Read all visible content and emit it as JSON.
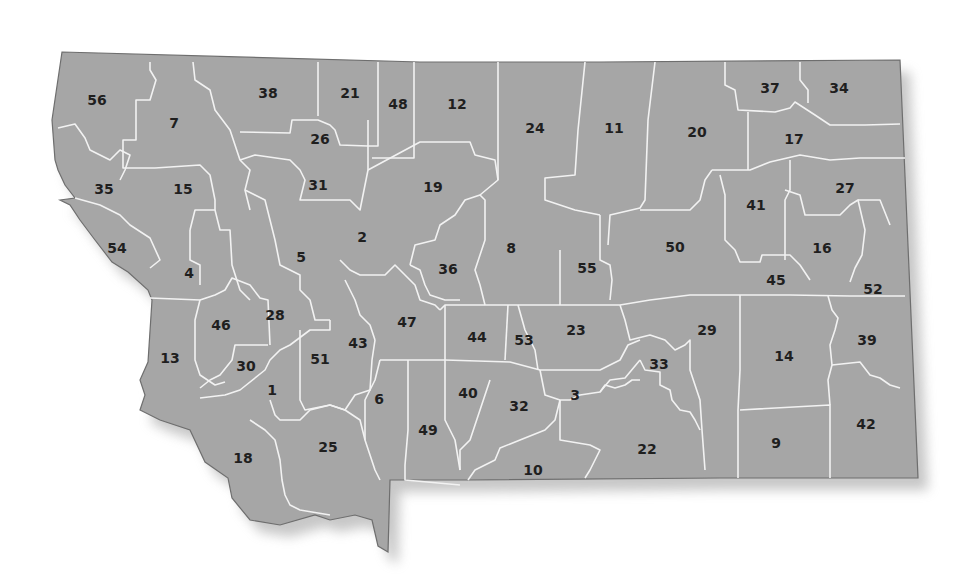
{
  "map": {
    "subject": "Montana county map with numbered counties",
    "colors": {
      "land": "#a6a6a6",
      "border": "#f2f2f2",
      "outline": "#6e6e6e",
      "label": "#1f1f1f",
      "background": "#ffffff"
    },
    "counties": [
      {
        "id": "56",
        "x": 97,
        "y": 100
      },
      {
        "id": "7",
        "x": 174,
        "y": 123
      },
      {
        "id": "38",
        "x": 268,
        "y": 93
      },
      {
        "id": "21",
        "x": 350,
        "y": 93
      },
      {
        "id": "48",
        "x": 398,
        "y": 104
      },
      {
        "id": "12",
        "x": 457,
        "y": 104
      },
      {
        "id": "24",
        "x": 535,
        "y": 128
      },
      {
        "id": "11",
        "x": 614,
        "y": 128
      },
      {
        "id": "20",
        "x": 697,
        "y": 132
      },
      {
        "id": "37",
        "x": 770,
        "y": 88
      },
      {
        "id": "34",
        "x": 839,
        "y": 88
      },
      {
        "id": "17",
        "x": 794,
        "y": 139
      },
      {
        "id": "26",
        "x": 320,
        "y": 139
      },
      {
        "id": "35",
        "x": 104,
        "y": 189
      },
      {
        "id": "15",
        "x": 183,
        "y": 189
      },
      {
        "id": "31",
        "x": 318,
        "y": 185
      },
      {
        "id": "19",
        "x": 433,
        "y": 187
      },
      {
        "id": "41",
        "x": 756,
        "y": 205
      },
      {
        "id": "27",
        "x": 845,
        "y": 188
      },
      {
        "id": "2",
        "x": 362,
        "y": 237
      },
      {
        "id": "8",
        "x": 511,
        "y": 248
      },
      {
        "id": "36",
        "x": 448,
        "y": 269
      },
      {
        "id": "55",
        "x": 587,
        "y": 268
      },
      {
        "id": "50",
        "x": 675,
        "y": 247
      },
      {
        "id": "16",
        "x": 822,
        "y": 248
      },
      {
        "id": "45",
        "x": 776,
        "y": 280
      },
      {
        "id": "52",
        "x": 873,
        "y": 289
      },
      {
        "id": "54",
        "x": 117,
        "y": 248
      },
      {
        "id": "4",
        "x": 189,
        "y": 273
      },
      {
        "id": "5",
        "x": 301,
        "y": 257
      },
      {
        "id": "46",
        "x": 221,
        "y": 325
      },
      {
        "id": "28",
        "x": 275,
        "y": 315
      },
      {
        "id": "47",
        "x": 407,
        "y": 322
      },
      {
        "id": "44",
        "x": 477,
        "y": 337
      },
      {
        "id": "53",
        "x": 524,
        "y": 340
      },
      {
        "id": "23",
        "x": 576,
        "y": 330
      },
      {
        "id": "29",
        "x": 707,
        "y": 330
      },
      {
        "id": "14",
        "x": 784,
        "y": 356
      },
      {
        "id": "39",
        "x": 867,
        "y": 340
      },
      {
        "id": "13",
        "x": 170,
        "y": 358
      },
      {
        "id": "30",
        "x": 246,
        "y": 366
      },
      {
        "id": "51",
        "x": 320,
        "y": 359
      },
      {
        "id": "43",
        "x": 358,
        "y": 343
      },
      {
        "id": "1",
        "x": 272,
        "y": 390
      },
      {
        "id": "6",
        "x": 379,
        "y": 399
      },
      {
        "id": "40",
        "x": 468,
        "y": 393
      },
      {
        "id": "32",
        "x": 519,
        "y": 406
      },
      {
        "id": "3",
        "x": 575,
        "y": 395
      },
      {
        "id": "33",
        "x": 659,
        "y": 364
      },
      {
        "id": "49",
        "x": 428,
        "y": 430
      },
      {
        "id": "18",
        "x": 243,
        "y": 458
      },
      {
        "id": "25",
        "x": 328,
        "y": 447
      },
      {
        "id": "22",
        "x": 647,
        "y": 449
      },
      {
        "id": "9",
        "x": 776,
        "y": 443
      },
      {
        "id": "42",
        "x": 866,
        "y": 424
      },
      {
        "id": "10",
        "x": 533,
        "y": 470
      }
    ]
  }
}
